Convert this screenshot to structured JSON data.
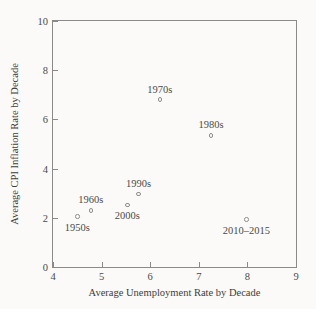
{
  "chart_data": {
    "type": "scatter",
    "title": "",
    "xlabel": "Average Unemployment Rate by Decade",
    "ylabel": "Average CPI Inflation Rate by Decade",
    "xlim": [
      4,
      9
    ],
    "ylim": [
      0,
      10
    ],
    "xticks": [
      4,
      5,
      6,
      7,
      8,
      9
    ],
    "yticks": [
      0,
      2,
      4,
      6,
      8,
      10
    ],
    "xticklabels": [
      "4",
      "5",
      "6",
      "7",
      "8",
      "9"
    ],
    "yticklabels": [
      "0",
      "2",
      "4",
      "6",
      "8",
      "10"
    ],
    "grid": false,
    "legend": false,
    "marker": "open-circle",
    "marker_color": "#8d8d8a",
    "points": [
      {
        "label": "1950s",
        "x": 4.5,
        "y": 2.05,
        "label_pos": "below"
      },
      {
        "label": "1960s",
        "x": 4.78,
        "y": 2.3,
        "label_pos": "above"
      },
      {
        "label": "1970s",
        "x": 6.2,
        "y": 6.8,
        "label_pos": "above"
      },
      {
        "label": "1980s",
        "x": 7.25,
        "y": 5.35,
        "label_pos": "above"
      },
      {
        "label": "1990s",
        "x": 5.76,
        "y": 2.97,
        "label_pos": "above"
      },
      {
        "label": "2000s",
        "x": 5.53,
        "y": 2.52,
        "label_pos": "below"
      },
      {
        "label": "2010–2015",
        "x": 7.98,
        "y": 1.93,
        "label_pos": "below"
      }
    ]
  },
  "style": {
    "background": "#fbfaf8",
    "axis_color": "#8a8a86",
    "text_color": "#4a4a48"
  }
}
